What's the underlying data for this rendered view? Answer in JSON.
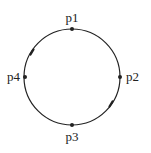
{
  "diagram": {
    "type": "circle-with-points",
    "circle": {
      "cx": 72,
      "cy": 77,
      "r": 48,
      "stroke": "#222222"
    },
    "points": [
      {
        "id": "p1",
        "label": "p1",
        "x": 72,
        "y": 29,
        "label_x": 72,
        "label_y": 22,
        "anchor": "middle"
      },
      {
        "id": "p2",
        "label": "p2",
        "x": 120,
        "y": 77,
        "label_x": 126,
        "label_y": 81,
        "anchor": "start"
      },
      {
        "id": "p3",
        "label": "p3",
        "x": 72,
        "y": 125,
        "label_x": 72,
        "label_y": 141,
        "anchor": "middle"
      },
      {
        "id": "p4",
        "label": "p4",
        "x": 25,
        "y": 77,
        "label_x": 20,
        "label_y": 81,
        "anchor": "end"
      }
    ],
    "direction_marks": [
      {
        "position": "upper-left",
        "x": 32,
        "y": 52
      },
      {
        "position": "lower-right",
        "x": 111,
        "y": 104
      }
    ]
  }
}
